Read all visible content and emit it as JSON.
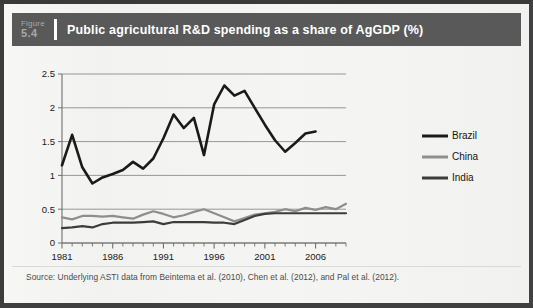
{
  "figure": {
    "label_word": "Figure",
    "number": "5.4",
    "title": "Public agricultural R&D spending as a share of AgGDP (%)",
    "source": "Source: Underlying ASTI data from Beintema et al. (2010), Chen et al. (2012), and Pal et al. (2012)."
  },
  "colors": {
    "header_bar": "#595959",
    "header_text": "#ffffff",
    "figure_number_text": "#a8a8a8",
    "page_background": "#f4f4f2",
    "gridline": "#8c8c8c",
    "axis": "#6e6e6e",
    "brazil": "#1a1a1a",
    "china": "#8e8e8e",
    "india": "#3c3c3c"
  },
  "chart_data": {
    "type": "line",
    "title": "Public agricultural R&D spending as a share of AgGDP (%)",
    "xlabel": "",
    "ylabel": "",
    "xlim": [
      1981,
      2009
    ],
    "ylim": [
      0,
      2.5
    ],
    "yticks": [
      0,
      0.5,
      1,
      1.5,
      2,
      2.5
    ],
    "ytick_labels": [
      "0",
      "0.5",
      "1",
      "1.5",
      "2",
      "2.5"
    ],
    "xticks": [
      1981,
      1986,
      1991,
      1996,
      2001,
      2006
    ],
    "xtick_labels": [
      "1981",
      "1986",
      "1991",
      "1996",
      "2001",
      "2006"
    ],
    "minor_xticks_every": 1,
    "grid": "horizontal",
    "legend_position": "right",
    "x": [
      1981,
      1982,
      1983,
      1984,
      1985,
      1986,
      1987,
      1988,
      1989,
      1990,
      1991,
      1992,
      1993,
      1994,
      1995,
      1996,
      1997,
      1998,
      1999,
      2000,
      2001,
      2002,
      2003,
      2004,
      2005,
      2006,
      2007,
      2008,
      2009
    ],
    "series": [
      {
        "name": "Brazil",
        "color": "#1a1a1a",
        "x": [
          1981,
          1982,
          1983,
          1984,
          1985,
          1986,
          1987,
          1988,
          1989,
          1990,
          1991,
          1992,
          1993,
          1994,
          1995,
          1996,
          1997,
          1998,
          1999,
          2000,
          2001,
          2002,
          2003,
          2004,
          2005,
          2006
        ],
        "values": [
          1.15,
          1.6,
          1.12,
          0.88,
          0.97,
          1.02,
          1.08,
          1.2,
          1.1,
          1.25,
          1.55,
          1.9,
          1.7,
          1.85,
          1.3,
          2.05,
          2.33,
          2.18,
          2.25,
          2.0,
          1.75,
          1.52,
          1.35,
          1.48,
          1.62,
          1.65
        ]
      },
      {
        "name": "China",
        "color": "#8e8e8e",
        "x": [
          1981,
          1982,
          1983,
          1984,
          1985,
          1986,
          1987,
          1988,
          1989,
          1990,
          1991,
          1992,
          1993,
          1994,
          1995,
          1996,
          1997,
          1998,
          1999,
          2000,
          2001,
          2002,
          2003,
          2004,
          2005,
          2006,
          2007,
          2008,
          2009
        ],
        "values": [
          0.38,
          0.35,
          0.4,
          0.4,
          0.39,
          0.4,
          0.38,
          0.36,
          0.42,
          0.47,
          0.43,
          0.38,
          0.41,
          0.46,
          0.5,
          0.44,
          0.38,
          0.32,
          0.37,
          0.42,
          0.44,
          0.46,
          0.5,
          0.47,
          0.52,
          0.49,
          0.53,
          0.5,
          0.58
        ]
      },
      {
        "name": "India",
        "color": "#3c3c3c",
        "x": [
          1981,
          1982,
          1983,
          1984,
          1985,
          1986,
          1987,
          1988,
          1989,
          1990,
          1991,
          1992,
          1993,
          1994,
          1995,
          1996,
          1997,
          1998,
          1999,
          2000,
          2001,
          2002,
          2003,
          2004,
          2005,
          2006,
          2007,
          2008,
          2009
        ],
        "values": [
          0.22,
          0.23,
          0.25,
          0.23,
          0.28,
          0.3,
          0.3,
          0.3,
          0.31,
          0.32,
          0.28,
          0.31,
          0.31,
          0.31,
          0.31,
          0.3,
          0.3,
          0.28,
          0.34,
          0.4,
          0.43,
          0.44,
          0.44,
          0.44,
          0.44,
          0.44,
          0.44,
          0.44,
          0.44
        ]
      }
    ]
  }
}
